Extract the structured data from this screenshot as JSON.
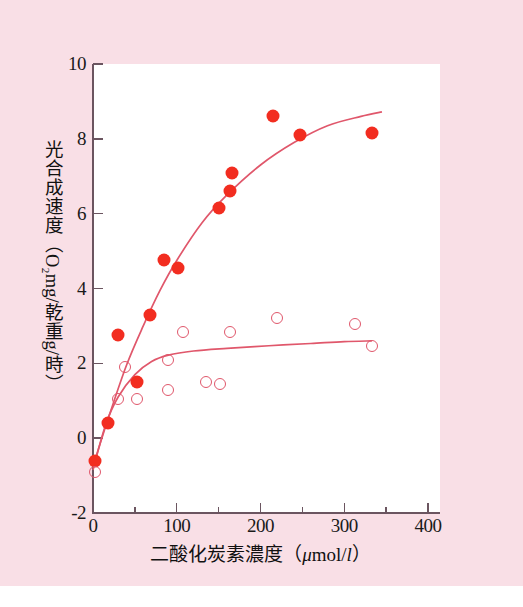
{
  "figure": {
    "background_color": "#f9dfe6",
    "plot_background_color": "#ffffff",
    "axis_color": "#6b5560",
    "filled_marker_color": "#f22d20",
    "open_marker_color": "#e0576b",
    "curve_color": "#e0576b"
  },
  "chart_data": {
    "type": "scatter",
    "title": "",
    "xlabel": "二酸化炭素濃度（μmol/l）",
    "ylabel": "光合成速度（O₂mg/乾重 g/時）",
    "xlabel_parts": {
      "text": "二酸化炭素濃度",
      "open_paren": "（",
      "unit_mu": "μ",
      "unit_mol": "mol/",
      "unit_litre": "l",
      "close_paren": "）"
    },
    "ylabel_parts": {
      "line1": "光合成速度",
      "open_paren": "（",
      "o2": "O₂",
      "mg_slash": "mg/",
      "dry_weight": "乾重",
      "g_slash": "g/",
      "hour": "時",
      "close_paren": "）"
    },
    "xlim": [
      0,
      400
    ],
    "ylim": [
      -2,
      10
    ],
    "xticks": [
      0,
      100,
      200,
      300,
      400
    ],
    "yticks": [
      -2,
      0,
      2,
      4,
      6,
      8,
      10
    ],
    "xticklabels": [
      "0",
      "100",
      "200",
      "300",
      "400"
    ],
    "yticklabels": [
      "-2",
      "0",
      "2",
      "4",
      "6",
      "8",
      "10"
    ],
    "xminor_ticks": [
      50,
      150,
      250,
      350
    ],
    "yminor_ticks": [],
    "grid": false,
    "legend": "none",
    "series": [
      {
        "name": "filled-circles",
        "marker": "filled-circle",
        "color": "#f22d20",
        "points": [
          {
            "x": 2,
            "y": -0.6
          },
          {
            "x": 18,
            "y": 0.4
          },
          {
            "x": 30,
            "y": 2.75
          },
          {
            "x": 52,
            "y": 1.5
          },
          {
            "x": 68,
            "y": 3.3
          },
          {
            "x": 85,
            "y": 4.75
          },
          {
            "x": 102,
            "y": 4.55
          },
          {
            "x": 150,
            "y": 6.15
          },
          {
            "x": 163,
            "y": 6.6
          },
          {
            "x": 166,
            "y": 7.1
          },
          {
            "x": 215,
            "y": 8.6
          },
          {
            "x": 247,
            "y": 8.1
          },
          {
            "x": 333,
            "y": 8.15
          }
        ],
        "fit_curve": [
          {
            "x": 0,
            "y": -0.75
          },
          {
            "x": 20,
            "y": 0.65
          },
          {
            "x": 40,
            "y": 1.95
          },
          {
            "x": 60,
            "y": 3.0
          },
          {
            "x": 80,
            "y": 3.95
          },
          {
            "x": 100,
            "y": 4.75
          },
          {
            "x": 130,
            "y": 5.75
          },
          {
            "x": 160,
            "y": 6.5
          },
          {
            "x": 200,
            "y": 7.3
          },
          {
            "x": 240,
            "y": 7.9
          },
          {
            "x": 280,
            "y": 8.35
          },
          {
            "x": 320,
            "y": 8.6
          },
          {
            "x": 345,
            "y": 8.72
          }
        ]
      },
      {
        "name": "open-circles",
        "marker": "open-circle",
        "color": "#e0576b",
        "points": [
          {
            "x": 2,
            "y": -0.9
          },
          {
            "x": 30,
            "y": 1.05
          },
          {
            "x": 38,
            "y": 1.9
          },
          {
            "x": 53,
            "y": 1.05
          },
          {
            "x": 90,
            "y": 2.1
          },
          {
            "x": 90,
            "y": 1.3
          },
          {
            "x": 107,
            "y": 2.85
          },
          {
            "x": 135,
            "y": 1.5
          },
          {
            "x": 152,
            "y": 1.45
          },
          {
            "x": 163,
            "y": 2.85
          },
          {
            "x": 220,
            "y": 3.2
          },
          {
            "x": 313,
            "y": 3.05
          },
          {
            "x": 333,
            "y": 2.45
          }
        ],
        "fit_curve": [
          {
            "x": 0,
            "y": -0.85
          },
          {
            "x": 15,
            "y": 0.35
          },
          {
            "x": 30,
            "y": 1.1
          },
          {
            "x": 50,
            "y": 1.7
          },
          {
            "x": 70,
            "y": 2.05
          },
          {
            "x": 90,
            "y": 2.22
          },
          {
            "x": 120,
            "y": 2.33
          },
          {
            "x": 160,
            "y": 2.4
          },
          {
            "x": 210,
            "y": 2.47
          },
          {
            "x": 260,
            "y": 2.53
          },
          {
            "x": 300,
            "y": 2.58
          },
          {
            "x": 333,
            "y": 2.6
          }
        ]
      }
    ]
  }
}
